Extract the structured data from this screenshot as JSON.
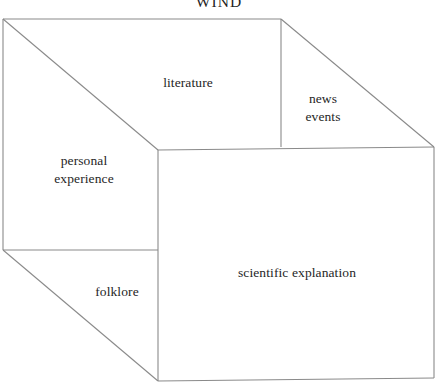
{
  "figure": {
    "title": "WIND",
    "type": "3d-box-diagram",
    "labels": {
      "top_left_face": "literature",
      "top_right_face": "news\nevents",
      "left_upper_face": "personal\nexperience",
      "left_lower_face": "folklore",
      "front_face": "scientific explanation"
    },
    "colors": {
      "background": "#ffffff",
      "edge": "#8a8a8a",
      "text": "#262626"
    },
    "geometry": {
      "top_back_left": [
        3,
        19
      ],
      "top_back_right": [
        281,
        19
      ],
      "top_divider_bottom": [
        281,
        147
      ],
      "right_back_corner": [
        434,
        147
      ],
      "mid_left": [
        3,
        250
      ],
      "front_top_left": [
        158,
        150
      ],
      "front_bottom_left": [
        158,
        381
      ],
      "front_bottom_right": [
        434,
        378
      ],
      "front_top_right": [
        434,
        147
      ]
    }
  }
}
